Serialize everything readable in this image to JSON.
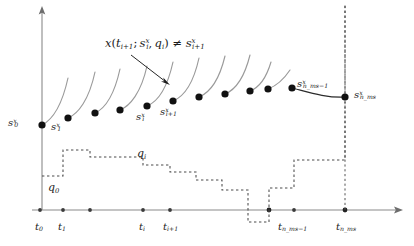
{
  "figure": {
    "colors": {
      "axis": "#8a8a8a",
      "trajectory_light": "#9a9a9a",
      "trajectory_dark": "#2b2b2b",
      "control_dashed": "#4a4a4a",
      "node_marker": "#111111",
      "text": "#1a1a1a",
      "background": "#ffffff"
    }
  },
  "annotation": {
    "id": "mismatch-condition",
    "text_parts": {
      "x": "x",
      "open": "(",
      "t": "t",
      "t_sub": "i+1",
      "semicolon": ";",
      "s": "s",
      "s_sub": "i",
      "s_sup": "x",
      "comma": ",",
      "q": "q",
      "q_sub": "i",
      "close": ")",
      "neq": "≠",
      "s2": "s",
      "s2_sub": "i+1",
      "s2_sup": "x"
    },
    "plain": "x(t_{i+1}; s_i^x, q_i) ≠ s_{i+1}^x"
  },
  "axis": {
    "x_axis_name": "time-axis",
    "y_axis_name": "state-axis",
    "x_ticks": [
      {
        "key": "t0",
        "base": "t",
        "sub": "0",
        "x": 40
      },
      {
        "key": "t1",
        "base": "t",
        "sub": "1",
        "x": 63
      },
      {
        "key": "ti",
        "base": "t",
        "sub": "i",
        "x": 143
      },
      {
        "key": "ti1",
        "base": "t",
        "sub": "i+1",
        "x": 170
      },
      {
        "key": "tnm1",
        "base": "t",
        "sub": "n_ms−1",
        "x": 294
      },
      {
        "key": "tnms",
        "base": "t",
        "sub": "n_ms",
        "x": 345
      }
    ],
    "tick_marks_x": [
      40,
      63,
      90,
      143,
      170,
      269,
      294,
      345
    ]
  },
  "states": [
    {
      "key": "s0",
      "base": "s",
      "sub": "0",
      "sup": "x",
      "x": 42,
      "y": 125,
      "label_x": 8,
      "label_y": 118
    },
    {
      "key": "s1",
      "base": "s",
      "sub": "1",
      "sup": "x",
      "x": 68,
      "y": 118,
      "label_x": 51,
      "label_y": 122
    },
    {
      "key": "si",
      "base": "s",
      "sub": "i",
      "sup": "x",
      "x": 147,
      "y": 106,
      "label_x": 136,
      "label_y": 112
    },
    {
      "key": "si1",
      "base": "s",
      "sub": "i+1",
      "sup": "x",
      "x": 173,
      "y": 101,
      "label_x": 160,
      "label_y": 107
    },
    {
      "key": "snm1",
      "base": "s",
      "sub": "n_ms−1",
      "sup": "x",
      "x": 292,
      "y": 88,
      "label_x": 298,
      "label_y": 80
    },
    {
      "key": "snms",
      "base": "s",
      "sub": "n_ms",
      "sup": "x",
      "x": 345,
      "y": 97,
      "label_x": 355,
      "label_y": 92
    }
  ],
  "unlabeled_nodes": [
    {
      "x": 95,
      "y": 113
    },
    {
      "x": 120,
      "y": 110
    },
    {
      "x": 199,
      "y": 97
    },
    {
      "x": 225,
      "y": 94
    },
    {
      "x": 250,
      "y": 91
    },
    {
      "x": 268,
      "y": 89
    }
  ],
  "controls": {
    "q0": {
      "base": "q",
      "sub": "0",
      "label_x": 48,
      "label_y": 183
    },
    "qi": {
      "base": "q",
      "sub": "i",
      "label_x": 137,
      "label_y": 150
    }
  },
  "icons": {
    "axis_arrow": "arrow-head-icon",
    "node_dot": "state-node-icon",
    "annotation_pointer": "arrow-pointer-icon"
  }
}
